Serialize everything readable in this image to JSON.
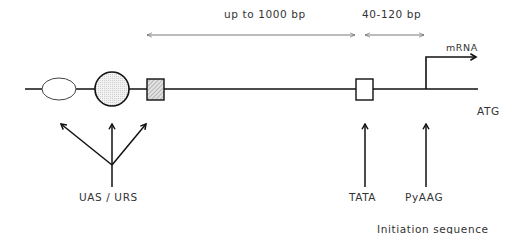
{
  "diagram": {
    "type": "gene-promoter-schematic",
    "spans": [
      {
        "label": "up to 1000 bp",
        "from": "UAS/URS",
        "to": "TATA"
      },
      {
        "label": "40-120 bp",
        "from": "TATA",
        "to": "transcription start"
      }
    ],
    "elements": [
      {
        "id": "ellipse-element",
        "shape": "ellipse",
        "group": "UAS / URS"
      },
      {
        "id": "circle-element",
        "shape": "circle",
        "fill": "stippled",
        "group": "UAS / URS"
      },
      {
        "id": "hatched-box",
        "shape": "square",
        "fill": "hatched",
        "group": "UAS / URS"
      },
      {
        "id": "tata-box",
        "shape": "square",
        "fill": "none",
        "label": "TATA"
      },
      {
        "id": "initiation-site",
        "label": "PyAAG"
      }
    ],
    "labels": {
      "span_long": "up to 1000 bp",
      "span_short": "40-120 bp",
      "mrna": "mRNA",
      "atg": "ATG",
      "uas_urs": "UAS / URS",
      "tata": "TATA",
      "pyaag": "PyAAG",
      "initiation": "Initiation sequence"
    },
    "colors": {
      "line": "#111111",
      "thin_arrow": "#555555",
      "text": "#333333",
      "stipple": "#e6e6e6",
      "hatch": "#cfcfcf"
    }
  }
}
